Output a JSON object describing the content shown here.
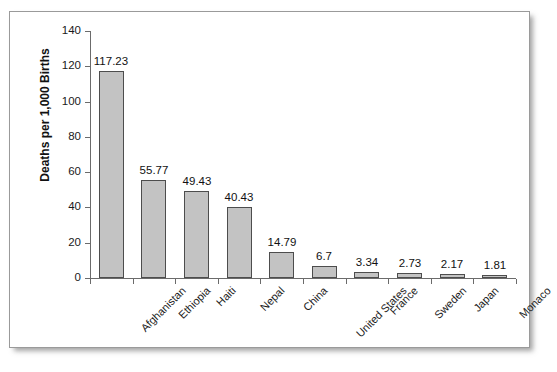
{
  "chart_data": {
    "type": "bar",
    "title": "",
    "xlabel": "",
    "ylabel": "Deaths per 1,000 Births",
    "ylim": [
      0,
      140
    ],
    "yticks": [
      0,
      20,
      40,
      60,
      80,
      100,
      120,
      140
    ],
    "grid": false,
    "legend": null,
    "bar_color": "#c3c3c3",
    "bar_border_color": "#4d4d4d",
    "categories": [
      "Afghanistan",
      "Ethiopia",
      "Haiti",
      "Nepal",
      "China",
      "United States",
      "France",
      "Sweden",
      "Japan",
      "Monaco"
    ],
    "values": [
      117.23,
      55.77,
      49.43,
      40.43,
      14.79,
      6.7,
      3.34,
      2.73,
      2.17,
      1.81
    ],
    "value_labels": [
      "117.23",
      "55.77",
      "49.43",
      "40.43",
      "14.79",
      "6.7",
      "3.34",
      "2.73",
      "2.17",
      "1.81"
    ]
  }
}
